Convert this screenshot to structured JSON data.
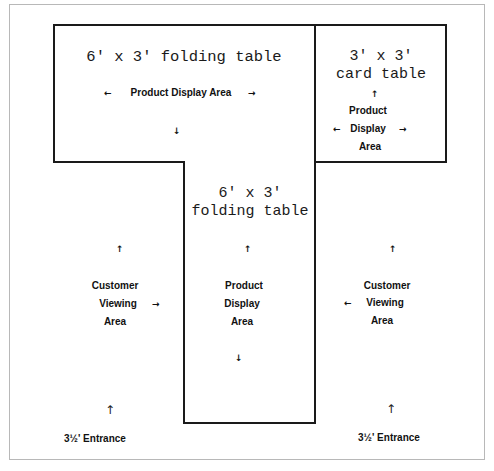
{
  "diagram": {
    "type": "booth-layout",
    "tables": [
      {
        "id": "top-folding-table",
        "title": "6' x 3' folding table",
        "label": "Product Display Area",
        "arrows": [
          "left",
          "right",
          "down"
        ]
      },
      {
        "id": "card-table",
        "title_line1": "3' x 3'",
        "title_line2": "card table",
        "label_lines": [
          "Product",
          "Display",
          "Area"
        ],
        "arrows": [
          "up",
          "left",
          "right"
        ]
      },
      {
        "id": "center-folding-table",
        "title_line1": "6' x 3'",
        "title_line2": "folding table",
        "label_lines": [
          "Product",
          "Display",
          "Area"
        ],
        "arrows": [
          "up",
          "down"
        ]
      }
    ],
    "viewing_areas": [
      {
        "id": "left-viewing-area",
        "label_lines": [
          "Customer",
          "Viewing",
          "Area"
        ],
        "arrows": [
          "up",
          "right"
        ]
      },
      {
        "id": "right-viewing-area",
        "label_lines": [
          "Customer",
          "Viewing",
          "Area"
        ],
        "arrows": [
          "up",
          "left"
        ]
      }
    ],
    "entrances": [
      {
        "id": "left-entrance",
        "label": "3½' Entrance"
      },
      {
        "id": "right-entrance",
        "label": "3½' Entrance"
      }
    ],
    "glyphs": {
      "up": "↑",
      "down": "↓",
      "left": "←",
      "right": "→"
    }
  }
}
